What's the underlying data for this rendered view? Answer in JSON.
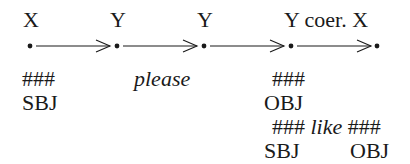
{
  "diagram": {
    "nodes": [
      {
        "id": "n1",
        "top_label": "X",
        "x": 30
      },
      {
        "id": "n2",
        "top_label": "Y",
        "x": 117
      },
      {
        "id": "n3",
        "top_label": "Y",
        "x": 204
      },
      {
        "id": "n4",
        "top_label": "Y coer. X",
        "x": 291
      },
      {
        "id": "n5",
        "top_label": "",
        "x": 377
      }
    ],
    "edges": [
      {
        "from": "n1",
        "to": "n2",
        "label": ""
      },
      {
        "from": "n2",
        "to": "n3",
        "label": "please"
      },
      {
        "from": "n3",
        "to": "n4",
        "label": ""
      },
      {
        "from": "n4",
        "to": "n5",
        "label": ""
      }
    ],
    "annotations": {
      "n1_hash": "###",
      "n1_role": "SBJ",
      "edge2_label": "please",
      "n4_hash": "###",
      "n4_role": "OBJ",
      "like_left_hash": "###",
      "like_word": "like",
      "like_right_hash": "###",
      "like_left_role": "SBJ",
      "like_right_role": "OBJ"
    },
    "top_labels": {
      "n1": "X",
      "n2": "Y",
      "n3": "Y",
      "n4": "Y coer. X"
    }
  }
}
